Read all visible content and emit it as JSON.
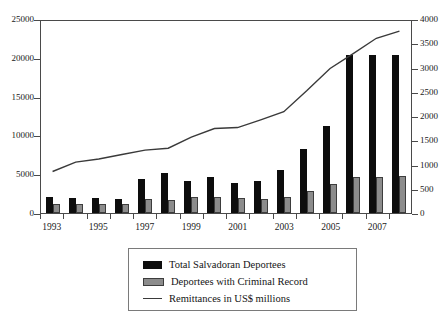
{
  "chart_data": {
    "type": "bar",
    "title": "",
    "subtitle": "",
    "xlabel": "",
    "ylabel": "",
    "ylabel_right": "",
    "grid": false,
    "legend_position": "bottom-center",
    "x": [
      1993,
      1994,
      1995,
      1996,
      1997,
      1998,
      1999,
      2000,
      2001,
      2002,
      2003,
      2004,
      2005,
      2006,
      2007,
      2008
    ],
    "categories": [
      "1993",
      "1994",
      "1995",
      "1996",
      "1997",
      "1998",
      "1999",
      "2000",
      "2001",
      "2002",
      "2003",
      "2004",
      "2005",
      "2006",
      "2007",
      "2008"
    ],
    "xtick_labels": [
      "1993",
      "1995",
      "1997",
      "1999",
      "2001",
      "2003",
      "2005",
      "2007"
    ],
    "left_axis": {
      "min": 0,
      "max": 25000,
      "ticks": [
        0,
        5000,
        10000,
        15000,
        20000,
        25000
      ],
      "tick_labels": [
        "0",
        "5000",
        "10000",
        "15000",
        "20000",
        "25000"
      ]
    },
    "right_axis": {
      "min": 0,
      "max": 4000,
      "ticks": [
        0,
        500,
        1000,
        1500,
        2000,
        2500,
        3000,
        3500,
        4000
      ],
      "tick_labels": [
        "0",
        "500",
        "1000",
        "1500",
        "2000",
        "2500",
        "3000",
        "3500",
        "4000"
      ]
    },
    "series": [
      {
        "name": "Total Salvadoran Deportees",
        "type": "bar",
        "axis": "left",
        "color": "#0d0d0d",
        "values": [
          2100,
          1900,
          1900,
          1800,
          4400,
          5200,
          4100,
          4600,
          3900,
          4100,
          5600,
          8300,
          11200,
          20300,
          20300,
          20300
        ]
      },
      {
        "name": "Deportees with Criminal Record",
        "type": "bar",
        "axis": "left",
        "color": "#8c8c8c",
        "values": [
          1200,
          1100,
          1100,
          1100,
          1800,
          1700,
          2000,
          2100,
          1900,
          1800,
          2100,
          2900,
          3700,
          4700,
          4700,
          4800
        ]
      },
      {
        "name": "Remittances in US$ millions",
        "type": "line",
        "axis": "right",
        "color": "#3a3a3a",
        "values": [
          865,
          1060,
          1125,
          1220,
          1310,
          1350,
          1580,
          1760,
          1780,
          1940,
          2110,
          2550,
          3010,
          3320,
          3640,
          3790
        ]
      }
    ]
  },
  "legend": {
    "items": [
      {
        "label": "Total Salvadoran Deportees",
        "marker": "black-square-swatch"
      },
      {
        "label": "Deportees with Criminal Record",
        "marker": "gray-square-swatch"
      },
      {
        "label": "Remittances in US$ millions",
        "marker": "line-swatch"
      }
    ]
  }
}
